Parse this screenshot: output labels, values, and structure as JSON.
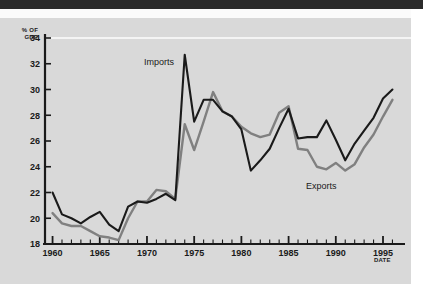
{
  "figure": {
    "background_color": "#d9d9d9",
    "ink_color": "#1a1a1a",
    "page_margin_color": "#ffffff",
    "scan_band_color": "#2b2b2b"
  },
  "axes": {
    "y_axis_caption_line1": "% OF",
    "y_axis_caption_line2": "GDP",
    "x_axis_caption": "DATE"
  },
  "labels": {
    "imports": "Imports",
    "exports": "Exports"
  },
  "chart_data": {
    "type": "line",
    "title": "",
    "subtitle": "",
    "xlabel": "DATE",
    "ylabel": "% OF GDP",
    "xlim": [
      1959.2,
      1996.8
    ],
    "ylim": [
      18,
      34.6
    ],
    "grid": false,
    "gridline_values": [
      34
    ],
    "legend_position": "inline-annotation",
    "y_ticks": [
      18,
      20,
      22,
      24,
      26,
      28,
      30,
      32,
      34
    ],
    "y_tick_labels": [
      "18",
      "20",
      "22",
      "24",
      "26",
      "28",
      "30",
      "32",
      "34"
    ],
    "x_ticks": [
      1960,
      1965,
      1970,
      1975,
      1980,
      1985,
      1990,
      1995
    ],
    "x_tick_labels": [
      "1960",
      "1965",
      "1970",
      "1975",
      "1980",
      "1985",
      "1990",
      "1995"
    ],
    "x_minor_tick_interval": 1,
    "x": [
      1960,
      1961,
      1962,
      1963,
      1964,
      1965,
      1966,
      1967,
      1968,
      1969,
      1970,
      1971,
      1972,
      1973,
      1974,
      1975,
      1976,
      1977,
      1978,
      1979,
      1980,
      1981,
      1982,
      1983,
      1984,
      1985,
      1986,
      1987,
      1988,
      1989,
      1990,
      1991,
      1992,
      1993,
      1994,
      1995,
      1996
    ],
    "series": [
      {
        "name": "Imports",
        "color": "#1a1a1a",
        "line_width": 2.1,
        "values": [
          22.0,
          20.3,
          20.0,
          19.6,
          20.1,
          20.5,
          19.5,
          19.0,
          20.9,
          21.3,
          21.2,
          21.5,
          21.9,
          21.4,
          32.7,
          27.5,
          29.2,
          29.2,
          28.3,
          27.9,
          26.9,
          23.7,
          24.5,
          25.4,
          27.0,
          28.5,
          26.2,
          26.3,
          26.3,
          27.6,
          26.1,
          24.5,
          25.8,
          26.8,
          27.8,
          29.3,
          30.0
        ]
      },
      {
        "name": "Exports",
        "color": "#808080",
        "line_width": 2.4,
        "values": [
          20.4,
          19.6,
          19.4,
          19.4,
          19.0,
          18.6,
          18.5,
          18.3,
          20.0,
          21.3,
          21.3,
          22.2,
          22.1,
          21.5,
          27.3,
          25.3,
          27.5,
          29.8,
          28.3,
          27.9,
          27.1,
          26.6,
          26.3,
          26.5,
          28.2,
          28.7,
          25.4,
          25.3,
          24.0,
          23.8,
          24.3,
          23.7,
          24.2,
          25.5,
          26.5,
          27.9,
          29.2
        ]
      }
    ]
  }
}
